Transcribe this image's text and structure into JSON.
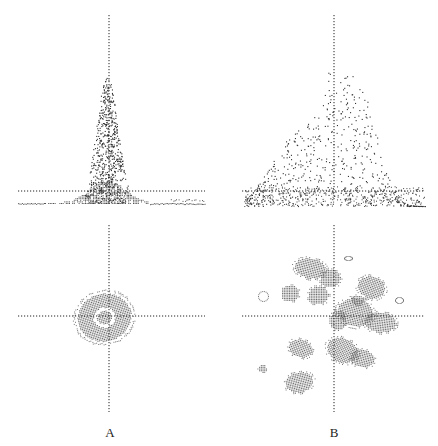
{
  "figure": {
    "panels": [
      {
        "id": "A",
        "label": "A",
        "surface": "single sharp peak",
        "contour": "single compact cluster centered near origin"
      },
      {
        "id": "B",
        "label": "B",
        "surface": "broad multi-peak distribution",
        "contour": "multiple scattered clusters"
      }
    ],
    "colors": {
      "dots": "#333333",
      "fill": "#7a7a7a",
      "axis": "#222222",
      "background": "#ffffff"
    }
  }
}
